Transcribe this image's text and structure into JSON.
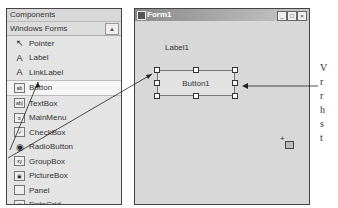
{
  "toolbox": {
    "title": "Components",
    "tab": "Windows Forms",
    "scroll_up": "▲",
    "items": [
      {
        "label": "Pointer",
        "icon": "↖",
        "name": "pointer"
      },
      {
        "label": "Label",
        "icon": "A",
        "name": "label"
      },
      {
        "label": "LinkLabel",
        "icon": "A",
        "name": "linklabel"
      },
      {
        "label": "Button",
        "icon": "ab",
        "name": "button",
        "selected": true
      },
      {
        "label": "TextBox",
        "icon": "ab|",
        "name": "textbox"
      },
      {
        "label": "MainMenu",
        "icon": "≡",
        "name": "mainmenu"
      },
      {
        "label": "CheckBox",
        "icon": "✓",
        "name": "checkbox"
      },
      {
        "label": "RadioButton",
        "icon": "◉",
        "name": "radiobutton"
      },
      {
        "label": "GroupBox",
        "icon": "xy",
        "name": "groupbox"
      },
      {
        "label": "PictureBox",
        "icon": "▣",
        "name": "picturebox"
      },
      {
        "label": "Panel",
        "icon": "",
        "name": "panel"
      },
      {
        "label": "DataGrid",
        "icon": "▦",
        "name": "datagrid"
      },
      {
        "label": "ListBox",
        "icon": "☰",
        "name": "listbox"
      }
    ]
  },
  "form": {
    "title": "Form1",
    "min": "_",
    "max": "□",
    "close": "×",
    "label": "Label1",
    "button": "Button1"
  },
  "side_text": [
    "V",
    "r",
    "r",
    "h",
    "s",
    "t"
  ]
}
